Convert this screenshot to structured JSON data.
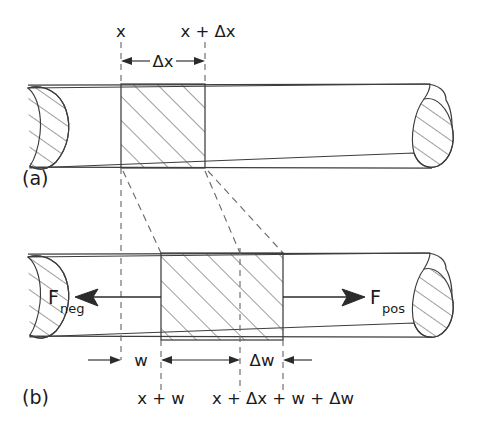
{
  "figure": {
    "title_visible": false,
    "panels": [
      {
        "id": "a",
        "panel_label": "(a)",
        "top_labels": {
          "left": "x",
          "right": "x + Δx"
        },
        "dimension_label": "Δx",
        "description_icons": {
          "left_break": "broken-tube-end-icon",
          "right_break": "broken-tube-end-icon",
          "slab": "hatched-slab-icon"
        }
      },
      {
        "id": "b",
        "panel_label": "(b)",
        "force_left_label": "F",
        "force_left_sub": "neg",
        "force_right_label": "F",
        "force_right_sub": "pos",
        "dimension_labels": {
          "w": "w",
          "dw": "Δw"
        },
        "bottom_labels": {
          "left": "x + w",
          "right": "x + Δx + w + Δw"
        }
      }
    ],
    "colors": {
      "ink": "#1a1a1a",
      "outline": "#3d3d3d",
      "dashed": "#6b6b6b",
      "hatch": "#4a4a4a",
      "background": "#ffffff"
    }
  }
}
